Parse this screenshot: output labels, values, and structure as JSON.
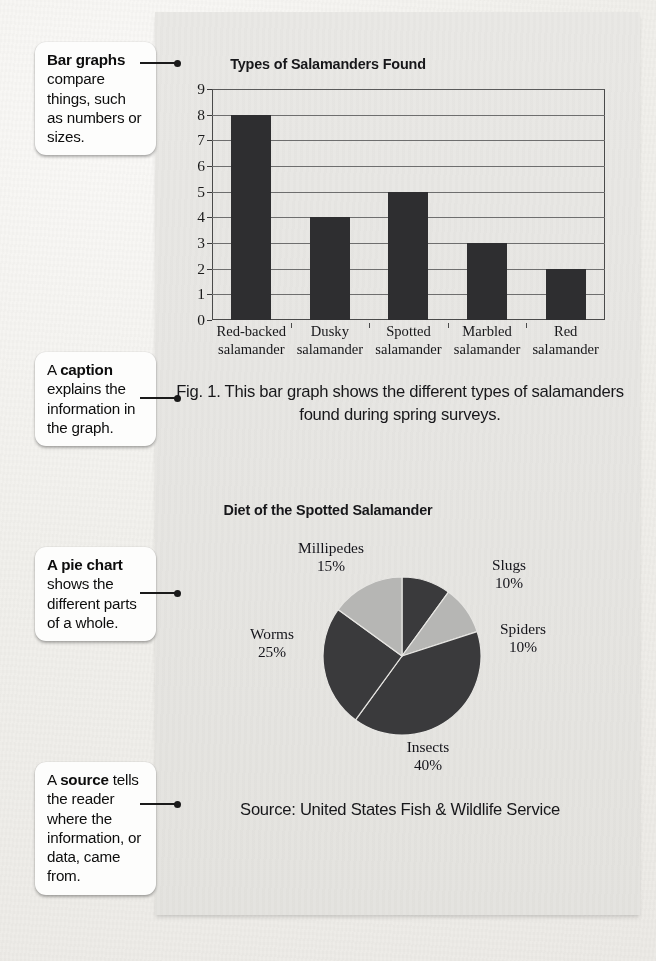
{
  "callouts": [
    {
      "id": "bar-graphs",
      "bold": "Bar graphs",
      "rest": " compare things, such as numbers or sizes."
    },
    {
      "id": "caption",
      "bold": "A caption",
      "rest": " explains the information in the graph.",
      "lead": "A ",
      "boldword": "caption",
      "tail": " explains the information in the graph."
    },
    {
      "id": "pie-chart",
      "bold": "A pie chart",
      "rest": " shows the different parts of a whole."
    },
    {
      "id": "source",
      "lead": "A ",
      "boldword": "source",
      "tail": " tells the reader where the information, or data, came from."
    }
  ],
  "callout_text": {
    "bar_graphs_bold": "Bar graphs",
    "bar_graphs_rest": " compare things, such as numbers or sizes.",
    "caption_lead": "A ",
    "caption_bold": "caption",
    "caption_tail": " explains the information in the graph.",
    "pie_chart_bold": "A pie chart",
    "pie_chart_rest": " shows the different parts of a whole.",
    "source_lead": "A ",
    "source_bold": "source",
    "source_tail": " tells the reader where the information, or data, came from."
  },
  "figure_caption": "Fig. 1. This bar graph shows the different types of salamanders found during spring surveys.",
  "source_credit": "Source: United States Fish & Wildlife Service",
  "colors": {
    "panel_bg": "#e7e6e3",
    "bar_fill": "#2e2e30",
    "pie_dark": "#3a3a3c",
    "pie_light": "#b6b6b4",
    "ink": "#17171a"
  },
  "chart_data": [
    {
      "type": "bar",
      "title": "Types of Salamanders Found",
      "categories": [
        "Red-backed salamander",
        "Dusky salamander",
        "Spotted salamander",
        "Marbled salamander",
        "Red salamander"
      ],
      "category_lines": [
        [
          "Red-backed",
          "salamander"
        ],
        [
          "Dusky",
          "salamander"
        ],
        [
          "Spotted",
          "salamander"
        ],
        [
          "Marbled",
          "salamander"
        ],
        [
          "Red",
          "salamander"
        ]
      ],
      "values": [
        8,
        4,
        5,
        3,
        2
      ],
      "xlabel": "",
      "ylabel": "",
      "ylim": [
        0,
        9
      ],
      "yticks": [
        0,
        1,
        2,
        3,
        4,
        5,
        6,
        7,
        8,
        9
      ],
      "grid": true,
      "legend": "none"
    },
    {
      "type": "pie",
      "title": "Diet of the Spotted Salamander",
      "labels": [
        "Slugs",
        "Spiders",
        "Insects",
        "Worms",
        "Millipedes"
      ],
      "values": [
        10,
        10,
        40,
        25,
        15
      ],
      "value_labels": [
        "10%",
        "10%",
        "40%",
        "25%",
        "15%"
      ],
      "slice_shades": [
        "dark",
        "light",
        "dark",
        "dark",
        "light"
      ],
      "start_angle_deg": 0,
      "direction": "clockwise",
      "legend": "labels-outside"
    }
  ]
}
